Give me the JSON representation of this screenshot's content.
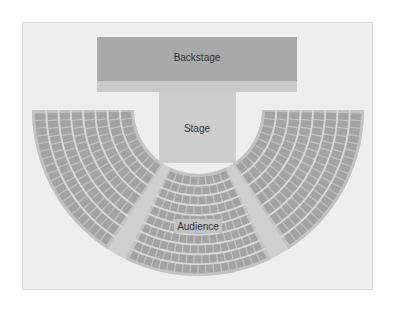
{
  "diagram": {
    "areas": {
      "backstage": {
        "label": "Backstage"
      },
      "stage": {
        "label": "Stage"
      },
      "audience": {
        "label": "Audience"
      }
    },
    "sections": [
      {
        "name": "left",
        "rows": 8
      },
      {
        "name": "center",
        "rows": 10
      },
      {
        "name": "right",
        "rows": 8
      }
    ],
    "colors": {
      "panel": "#eeeeee",
      "backstage": "#a9a9a9",
      "backstage_strip": "#c9c9c9",
      "stage": "#cdcdcd",
      "section_bg": "#c2c2c2",
      "seat": "#a3a3a3",
      "row_gap": "#d9d9d9",
      "aisle": "#cfcfcf"
    }
  }
}
